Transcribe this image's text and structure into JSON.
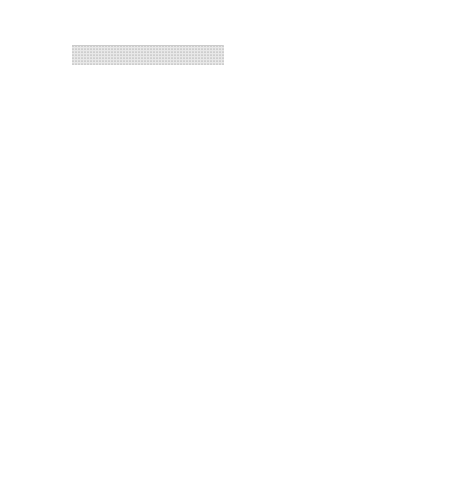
{
  "panels": [
    {
      "title": "Original Strata",
      "labels": [
        "Topsoil",
        "Sandstone",
        "Shale",
        "Dolomite",
        "Limestone"
      ]
    },
    {
      "title": "Immediately After the Cataclysm",
      "labels": [
        "Topsoil",
        "Sandstone",
        "Shale",
        "Dolomite",
        "Limestone"
      ]
    },
    {
      "title": "Present-Day Geomorphology",
      "annotation": "Serpent Mound"
    }
  ],
  "caption": "Figure 10. Nature Park of the"
}
